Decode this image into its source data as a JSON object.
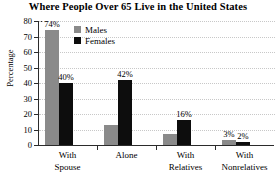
{
  "chart_data": {
    "type": "bar",
    "title": "Where People Over 65 Live in the United States",
    "xlabel": "",
    "ylabel": "Percentage",
    "ylim": [
      0,
      80
    ],
    "yticks": [
      0,
      10,
      20,
      30,
      40,
      50,
      60,
      70,
      80
    ],
    "grid": true,
    "legend_position": "upper-left-inside",
    "categories": [
      "With Spouse",
      "Alone",
      "With Relatives",
      "With Nonrelatives"
    ],
    "category_lines": [
      [
        "With",
        "Spouse"
      ],
      [
        "Alone",
        ""
      ],
      [
        "With",
        "Relatives"
      ],
      [
        "With",
        "Nonrelatives"
      ]
    ],
    "series": [
      {
        "name": "Males",
        "color": "#8a8a8a",
        "values": [
          74,
          13,
          7,
          3
        ],
        "labels": [
          "74%",
          "",
          "",
          "3%"
        ]
      },
      {
        "name": "Females",
        "color": "#0d0d0d",
        "values": [
          40,
          42,
          16,
          2
        ],
        "labels": [
          "40%",
          "42%",
          "16%",
          "2%"
        ]
      }
    ]
  },
  "legend": {
    "items": [
      {
        "label": "Males"
      },
      {
        "label": "Females"
      }
    ]
  }
}
